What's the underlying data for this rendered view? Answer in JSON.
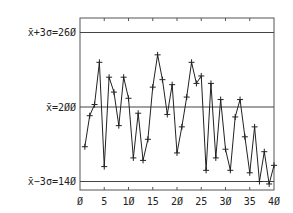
{
  "chart_data": {
    "type": "line",
    "title": "",
    "xlabel": "",
    "ylabel": "",
    "x": [
      1,
      2,
      3,
      4,
      5,
      6,
      7,
      8,
      9,
      10,
      11,
      12,
      13,
      14,
      15,
      16,
      17,
      18,
      19,
      20,
      21,
      22,
      23,
      24,
      25,
      26,
      27,
      28,
      29,
      30,
      31,
      32,
      33,
      34,
      35,
      36,
      37,
      38,
      39,
      40
    ],
    "values": [
      168,
      193,
      202,
      236,
      152,
      224,
      212,
      185,
      224,
      207,
      159,
      195,
      157,
      174,
      216,
      242,
      222,
      194,
      218,
      163,
      184,
      208,
      236,
      219,
      225,
      149,
      219,
      159,
      206,
      166,
      149,
      192,
      206,
      176,
      147,
      184,
      140,
      164,
      138,
      153
    ],
    "xlim": [
      0,
      40
    ],
    "ylim": [
      133,
      272
    ],
    "xticks": [
      "0",
      "5",
      "10",
      "15",
      "20",
      "25",
      "30",
      "35",
      "40"
    ],
    "xtick_values": [
      0,
      5,
      10,
      15,
      20,
      25,
      30,
      35,
      40
    ],
    "control_lines": [
      {
        "name": "ucl",
        "label": "x̄+3σ=260",
        "value": 260
      },
      {
        "name": "center",
        "label": "x̄=200",
        "value": 200
      },
      {
        "name": "lcl",
        "label": "x̄−3σ=140",
        "value": 140
      }
    ],
    "marker": "plus",
    "grid": false,
    "legend": null
  },
  "labels": {
    "ucl": "x̄+3σ=26Ø",
    "center": "x̄=2ØØ",
    "lcl": "x̄−3σ=14Ø",
    "xticks": [
      "Ø",
      "5",
      "1Ø",
      "15",
      "2Ø",
      "25",
      "3Ø",
      "35",
      "4Ø"
    ]
  },
  "colors": {
    "line": "#222222",
    "axis": "#444444",
    "background": "#ffffff"
  }
}
